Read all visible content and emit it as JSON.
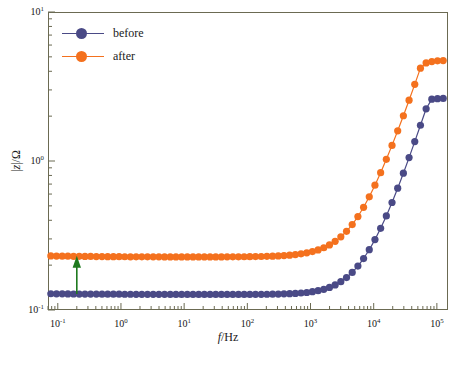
{
  "chart_data": {
    "type": "scatter",
    "title": "",
    "xlabel": "f/Hz",
    "ylabel": "|z|/Ω",
    "xscale": "log",
    "yscale": "log",
    "xlim": [
      0.07,
      150000
    ],
    "ylim": [
      0.1,
      10
    ],
    "grid": false,
    "legend_position": "top-left",
    "xticks": [
      0.1,
      1,
      10,
      100,
      1000,
      10000,
      100000
    ],
    "xticklabels": [
      "10-1",
      "100",
      "101",
      "102",
      "103",
      "104",
      "105"
    ],
    "yticks": [
      0.1,
      1,
      10
    ],
    "yticklabels": [
      "10-1",
      "100",
      "101"
    ],
    "series": [
      {
        "name": "before",
        "color": "#4a4a86",
        "plateau": 0.128,
        "x": [
          0.0776,
          0.0955,
          0.1175,
          0.1445,
          0.1778,
          0.2188,
          0.2692,
          0.3311,
          0.4074,
          0.5012,
          0.6166,
          0.7586,
          0.9333,
          1.148,
          1.413,
          1.738,
          2.138,
          2.63,
          3.236,
          3.981,
          4.898,
          6.026,
          7.413,
          9.12,
          11.22,
          13.8,
          16.98,
          20.89,
          25.7,
          31.62,
          38.9,
          47.86,
          58.88,
          72.44,
          89.13,
          109.6,
          134.9,
          165.9,
          204.2,
          251.2,
          309.0,
          380.2,
          467.7,
          575.4,
          707.9,
          871.0,
          1071.5,
          1318.3,
          1621.8,
          1995.3,
          2454.7,
          3019.9,
          3715.4,
          4570.9,
          5623.4,
          6918.3,
          8511.4,
          10471.3,
          12882.5,
          15848.9,
          19498.4,
          23988.3,
          29512.1,
          36307.8,
          44668.4,
          54954.1,
          67608.3,
          83176.4,
          102329.3,
          125892.5
        ],
        "y": [
          0.1285,
          0.1284,
          0.1283,
          0.1282,
          0.1281,
          0.128,
          0.128,
          0.1279,
          0.1279,
          0.1278,
          0.1278,
          0.1277,
          0.1277,
          0.1276,
          0.1276,
          0.1275,
          0.1275,
          0.1275,
          0.1274,
          0.1274,
          0.1274,
          0.1273,
          0.1273,
          0.1273,
          0.1273,
          0.1272,
          0.1272,
          0.1272,
          0.1272,
          0.1272,
          0.1272,
          0.1272,
          0.1272,
          0.1272,
          0.1273,
          0.1273,
          0.1274,
          0.1275,
          0.1276,
          0.1278,
          0.128,
          0.1283,
          0.1287,
          0.1292,
          0.13,
          0.1311,
          0.1327,
          0.1348,
          0.1377,
          0.1418,
          0.1473,
          0.1548,
          0.165,
          0.1787,
          0.1971,
          0.2215,
          0.2539,
          0.2967,
          0.3532,
          0.4279,
          0.5265,
          0.6567,
          0.8283,
          1.054,
          1.35,
          1.737,
          2.241,
          2.6,
          2.62,
          2.63
        ]
      },
      {
        "name": "after",
        "color": "#f4711e",
        "plateau": 0.228,
        "x": [
          0.0776,
          0.0955,
          0.1175,
          0.1445,
          0.1778,
          0.2188,
          0.2692,
          0.3311,
          0.4074,
          0.5012,
          0.6166,
          0.7586,
          0.9333,
          1.148,
          1.413,
          1.738,
          2.138,
          2.63,
          3.236,
          3.981,
          4.898,
          6.026,
          7.413,
          9.12,
          11.22,
          13.8,
          16.98,
          20.89,
          25.7,
          31.62,
          38.9,
          47.86,
          58.88,
          72.44,
          89.13,
          109.6,
          134.9,
          165.9,
          204.2,
          251.2,
          309.0,
          380.2,
          467.7,
          575.4,
          707.9,
          871.0,
          1071.5,
          1318.3,
          1621.8,
          1995.3,
          2454.7,
          3019.9,
          3715.4,
          4570.9,
          5623.4,
          6918.3,
          8511.4,
          10471.3,
          12882.5,
          15848.9,
          19498.4,
          23988.3,
          29512.1,
          36307.8,
          44668.4,
          54954.1,
          67608.3,
          83176.4,
          102329.3,
          125892.5
        ],
        "y": [
          0.2305,
          0.2302,
          0.2299,
          0.2296,
          0.2293,
          0.2291,
          0.2289,
          0.2287,
          0.2285,
          0.2283,
          0.2281,
          0.228,
          0.2279,
          0.2277,
          0.2276,
          0.2275,
          0.2275,
          0.2274,
          0.2273,
          0.2273,
          0.2272,
          0.2272,
          0.2272,
          0.2271,
          0.2271,
          0.2271,
          0.2271,
          0.2271,
          0.2271,
          0.2272,
          0.2272,
          0.2273,
          0.2274,
          0.2275,
          0.2277,
          0.2279,
          0.2282,
          0.2286,
          0.2291,
          0.2298,
          0.2307,
          0.2319,
          0.2334,
          0.2355,
          0.2382,
          0.2418,
          0.2466,
          0.2531,
          0.2617,
          0.2733,
          0.2888,
          0.3096,
          0.3374,
          0.3745,
          0.4238,
          0.4891,
          0.5752,
          0.688,
          0.8352,
          1.026,
          1.273,
          1.594,
          2.012,
          2.56,
          3.27,
          4.2,
          4.55,
          4.65,
          4.7,
          4.72
        ]
      }
    ],
    "annotations": [
      {
        "type": "arrow",
        "color": "#1f7a1f",
        "x": 0.2,
        "y_from": 0.128,
        "y_to": 0.228,
        "direction": "up",
        "label": ""
      }
    ]
  },
  "legend": {
    "items": [
      {
        "label": "before",
        "color": "#4a4a86"
      },
      {
        "label": "after",
        "color": "#f4711e"
      }
    ]
  },
  "axes": {
    "x_title_italic": "f",
    "x_title_rest": "/Hz",
    "y_title_bar1": "|",
    "y_title_italic": "z",
    "y_title_rest": "|/Ω"
  },
  "ticks": {
    "x": [
      {
        "mant": "10",
        "exp": "-1"
      },
      {
        "mant": "10",
        "exp": "0"
      },
      {
        "mant": "10",
        "exp": "1"
      },
      {
        "mant": "10",
        "exp": "2"
      },
      {
        "mant": "10",
        "exp": "3"
      },
      {
        "mant": "10",
        "exp": "4"
      },
      {
        "mant": "10",
        "exp": "5"
      }
    ],
    "y": [
      {
        "mant": "10",
        "exp": "1"
      },
      {
        "mant": "10",
        "exp": "0"
      },
      {
        "mant": "10",
        "exp": "-1"
      }
    ]
  },
  "style": {
    "frame_color": "#6b6a52",
    "background": "#ffffff",
    "navy": "#4a4a86",
    "orange": "#f4711e",
    "arrow_green": "#1f7a1f"
  }
}
